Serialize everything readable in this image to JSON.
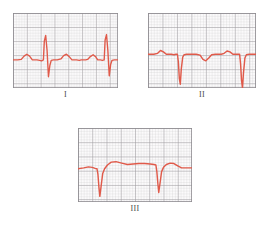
{
  "figure": {
    "background_color": "#ffffff"
  },
  "style": {
    "trace_color": "#e05a4a",
    "grid_minor_color": "#c9c6c9",
    "grid_major_color": "#9a979c",
    "grid_background": "#fbfafb",
    "border_color": "#8e8b90",
    "label_color": "#4a4a4a"
  },
  "panels": [
    {
      "id": "panel-1",
      "label": "I",
      "lead": "I",
      "grid": {
        "minor_px": 3,
        "major_every": 5,
        "cols": 35,
        "rows": 25
      },
      "baseline_pct": 50,
      "morphology": "upright QRS, tall positive R wave, small S, rounded positive T wave",
      "beats": 2,
      "path": "M0,50 L5,50 L9,49.5 L12,46 L15,44 L18,46 L21,50 L26,50 L29,50.5 L31,51 L33,50 L34,30 L35.5,24 L37,40 L38.5,68 L40,56 L41.5,50.5 L44,50 L48,50 L52,49 L55,45.5 L58,44 L61,46.5 L64,50 L69,50 L72,50.5 L74,50 L77,50 L79,50 L81,49.5 L84,46.5 L87,44.5 L90,47 L92,50 L95,50 L97,50.5 L99,50 L100,29 L101.5,23 L103,40 L104.5,67 L106,55 L107.5,50.5 L110,50 L114,50"
    },
    {
      "id": "panel-2",
      "label": "II",
      "lead": "II",
      "grid": {
        "minor_px": 3,
        "major_every": 5,
        "cols": 36,
        "rows": 25
      },
      "baseline_pct": 44,
      "morphology": "negative QS complexes, deep narrow downward deflections, shallow inverted T wave",
      "beats": 2,
      "path": "M0,44 L6,44 L10,43 L13,40 L16,41.5 L19,44 L24,44 L27,44.5 L29,44 L30.5,44 L31.5,52 L32.5,70 L33.5,76 L34.5,60 L36,47 L37.5,44.5 L40,44 L46,44 L50,44 L54,45 L57,49.5 L60,51 L63,48 L66,44.5 L70,44 L76,44 L79,43 L82,40.5 L85,41.5 L88,44 L92,44 L94,44 L95,44 L96,54 L97,72 L98,80 L99,64 L100.5,48 L102,44.5 L105,44 L112,44"
    },
    {
      "id": "panel-3",
      "label": "III",
      "lead": "III",
      "grid": {
        "minor_px": 3,
        "major_every": 5,
        "cols": 38,
        "rows": 24
      },
      "baseline_pct": 42,
      "morphology": "deep narrow negative QS spikes separated by broad rounded positive waves",
      "beats": 2,
      "path": "M0,43 L6,42 L11,41 L15,41.5 L18,42.5 L20,43 L21,49 L22,62 L23,72 L24.5,60 L26,48 L28,43 L31,39 L35,36 L40,35.5 L46,37 L52,38.5 L58,38 L64,37.5 L70,37.5 L76,38 L80,38.5 L82,39 L83,46 L84,58 L85,68 L86.5,57 L88,46 L90,41.5 L93,38.5 L97,37 L101,37.5 L105,40 L109,42 L114,42 L120,42"
    }
  ]
}
